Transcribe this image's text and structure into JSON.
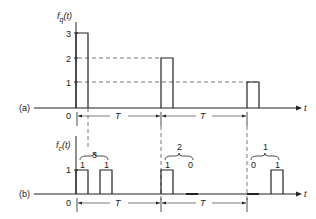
{
  "panel_a": {
    "tag": "(a)",
    "ylabel": "f",
    "ylabel_sub": "q",
    "ylabel_arg": "(t)",
    "yticks": [
      "3",
      "2",
      "1"
    ],
    "origin": "0",
    "xlabel": "t",
    "period_labels": [
      "T",
      "T"
    ],
    "pulses": [
      3,
      2,
      1
    ]
  },
  "panel_b": {
    "tag": "(b)",
    "ylabel": "f",
    "ylabel_sub": "c",
    "ylabel_arg": "(t)",
    "yticks": [
      "1"
    ],
    "origin": "0",
    "xlabel": "t",
    "period_labels": [
      "T",
      "T"
    ],
    "groups": [
      {
        "value": "3",
        "bits": [
          "1",
          "1"
        ]
      },
      {
        "value": "2",
        "bits": [
          "1",
          "0"
        ]
      },
      {
        "value": "1",
        "bits": [
          "0",
          "1"
        ]
      }
    ]
  },
  "colors": {
    "ink": "#222222",
    "dash": "#555555"
  }
}
